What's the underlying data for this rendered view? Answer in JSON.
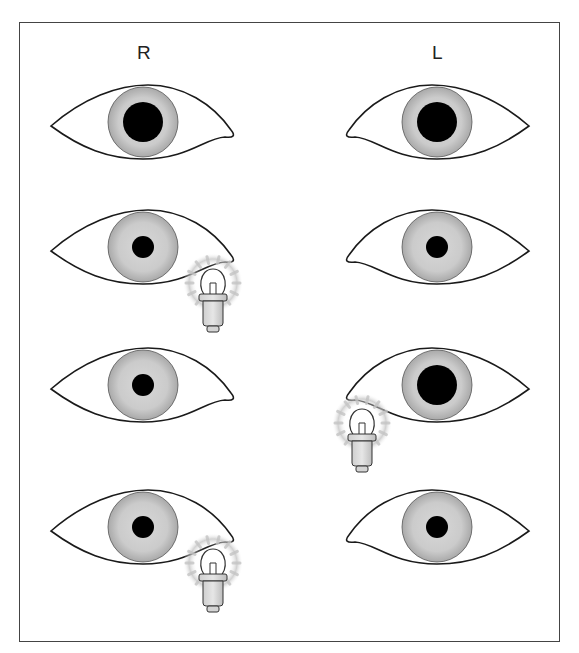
{
  "diagram": {
    "type": "swinging-flashlight-test",
    "labels": {
      "right": "R",
      "left": "L"
    },
    "colors": {
      "outline": "#1a1a1a",
      "iris": "#c8c8c8",
      "iris_edge": "#a8a8a8",
      "pupil": "#000000",
      "background": "#ffffff",
      "glow": "#b8b8b8"
    },
    "rows": [
      {
        "row": 1,
        "right_pupil": "large",
        "left_pupil": "large",
        "light": "none"
      },
      {
        "row": 2,
        "right_pupil": "small",
        "left_pupil": "small",
        "light": "right"
      },
      {
        "row": 3,
        "right_pupil": "small",
        "left_pupil": "large",
        "light": "left"
      },
      {
        "row": 4,
        "right_pupil": "small",
        "left_pupil": "small",
        "light": "right"
      }
    ]
  }
}
